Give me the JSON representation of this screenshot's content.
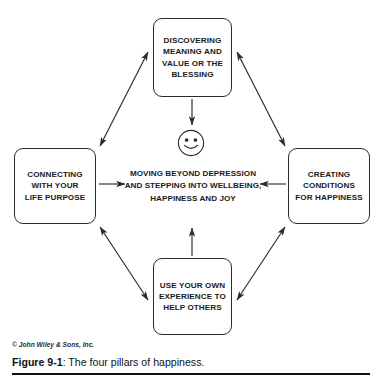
{
  "figure": {
    "caption_number": "Figure 9-1",
    "caption_separator": ": ",
    "caption_title": "The four pillars of happiness.",
    "credit": "© John Wiley & Sons, Inc."
  },
  "diagram": {
    "center": {
      "text": "MOVING BEYOND DEPRESSION\nAND STEPPING INTO WELLBEING,\nHAPPINESS AND JOY",
      "icon": "smiley-face-icon"
    },
    "pillars": [
      {
        "id": "discovering-meaning",
        "position": "top",
        "label": "DISCOVERING\nMEANING AND\nVALUE OR THE\nBLESSING"
      },
      {
        "id": "connecting-life-purpose",
        "position": "left",
        "label": "CONNECTING\nWITH YOUR\nLIFE PURPOSE"
      },
      {
        "id": "creating-conditions",
        "position": "right",
        "label": "CREATING\nCONDITIONS\nFOR HAPPINESS"
      },
      {
        "id": "use-your-own-experience",
        "position": "bottom",
        "label": "USE YOUR OWN\nEXPERIENCE TO\nHELP OTHERS"
      }
    ],
    "connectors": [
      {
        "id": "top-to-left",
        "style": "double-headed-arrow"
      },
      {
        "id": "top-to-right",
        "style": "double-headed-arrow"
      },
      {
        "id": "left-to-bottom",
        "style": "double-headed-arrow"
      },
      {
        "id": "right-to-bottom",
        "style": "double-headed-arrow"
      },
      {
        "id": "top-to-center",
        "style": "single-arrow-down"
      },
      {
        "id": "left-to-center",
        "style": "single-arrow-right"
      },
      {
        "id": "right-to-center",
        "style": "single-arrow-left"
      },
      {
        "id": "bottom-to-center",
        "style": "single-arrow-up"
      }
    ]
  },
  "colors": {
    "line": "#2b2b2b",
    "text": "#1a1a1a",
    "background": "#ffffff",
    "rule": "#111111"
  }
}
